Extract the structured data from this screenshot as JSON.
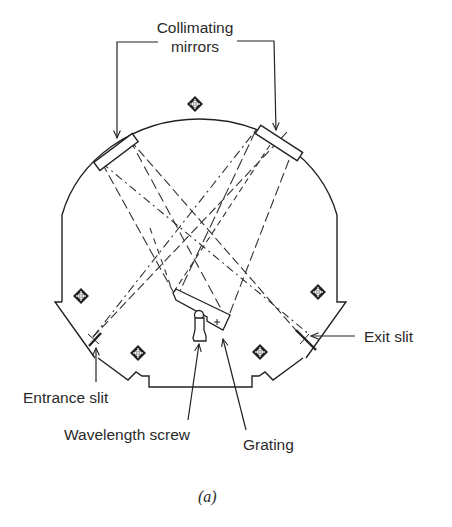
{
  "figure": {
    "caption": "(a)",
    "type": "monochromator schematic",
    "labels": {
      "collimating_mirrors_line1": "Collimating",
      "collimating_mirrors_line2": "mirrors",
      "exit_slit": "Exit slit",
      "entrance_slit": "Entrance slit",
      "wavelength_screw": "Wavelength screw",
      "grating": "Grating"
    },
    "components": [
      "housing-outline",
      "left-collimating-mirror",
      "right-collimating-mirror",
      "grating",
      "wavelength-screw",
      "entrance-slit",
      "exit-slit",
      "mounting-screws",
      "light-ray-paths"
    ],
    "colors": {
      "ink": "#2a2a2a",
      "background": "#ffffff"
    }
  }
}
